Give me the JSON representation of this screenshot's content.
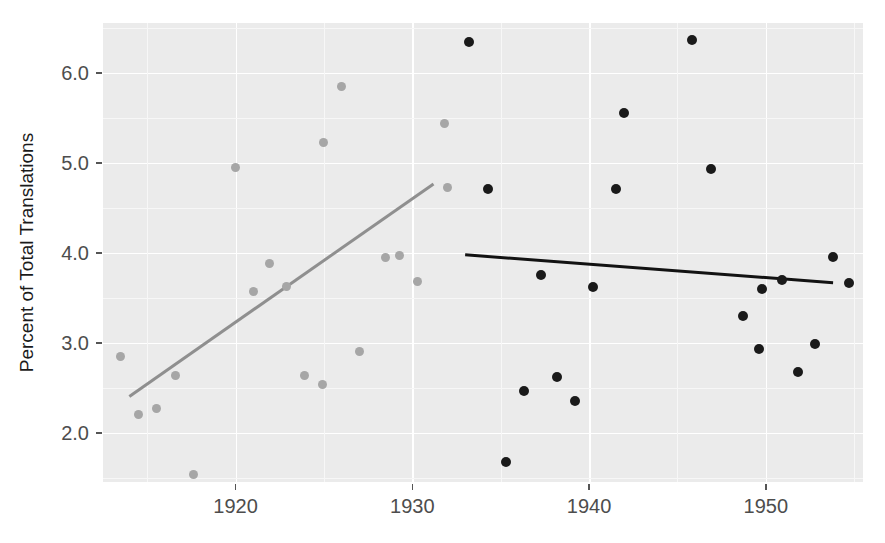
{
  "chart_data": {
    "type": "scatter",
    "title": "",
    "xlabel": "",
    "ylabel": "Percent of Total Translations",
    "xlim": [
      1912.5,
      1955.5
    ],
    "ylim": [
      1.45,
      6.55
    ],
    "xticks": [
      1920,
      1930,
      1940,
      1950
    ],
    "xticklabels": [
      "1920",
      "1930",
      "1940",
      "1950"
    ],
    "yticks": [
      2.0,
      3.0,
      4.0,
      5.0,
      6.0
    ],
    "yticklabels": [
      "2.0",
      "3.0",
      "4.0",
      "5.0",
      "6.0"
    ],
    "grid": true,
    "legend": "none",
    "panel_background": "#ebebeb",
    "series": [
      {
        "name": "early-period",
        "color": "#a6a6a6",
        "marker": "circle",
        "points": [
          {
            "x": 1913.5,
            "y": 2.85
          },
          {
            "x": 1914.5,
            "y": 2.2
          },
          {
            "x": 1915.5,
            "y": 2.27
          },
          {
            "x": 1916.6,
            "y": 2.63
          },
          {
            "x": 1917.6,
            "y": 1.53
          },
          {
            "x": 1920.0,
            "y": 4.95
          },
          {
            "x": 1921.0,
            "y": 3.57
          },
          {
            "x": 1921.9,
            "y": 3.88
          },
          {
            "x": 1922.9,
            "y": 3.62
          },
          {
            "x": 1923.9,
            "y": 2.63
          },
          {
            "x": 1924.9,
            "y": 2.53
          },
          {
            "x": 1925.0,
            "y": 5.22
          },
          {
            "x": 1926.0,
            "y": 5.85
          },
          {
            "x": 1927.0,
            "y": 2.9
          },
          {
            "x": 1928.5,
            "y": 3.95
          },
          {
            "x": 1929.3,
            "y": 3.97
          },
          {
            "x": 1930.3,
            "y": 3.68
          },
          {
            "x": 1931.8,
            "y": 5.43
          },
          {
            "x": 1932.0,
            "y": 4.72
          }
        ],
        "trend": {
          "x1": 1914.0,
          "y1": 2.41,
          "x2": 1931.2,
          "y2": 4.77,
          "color": "#8f8f8f"
        }
      },
      {
        "name": "late-period",
        "color": "#1a1a1a",
        "marker": "circle",
        "points": [
          {
            "x": 1933.2,
            "y": 6.34
          },
          {
            "x": 1934.3,
            "y": 4.71
          },
          {
            "x": 1935.3,
            "y": 1.67
          },
          {
            "x": 1936.3,
            "y": 2.46
          },
          {
            "x": 1937.3,
            "y": 3.75
          },
          {
            "x": 1938.2,
            "y": 2.62
          },
          {
            "x": 1939.2,
            "y": 2.35
          },
          {
            "x": 1940.2,
            "y": 3.62
          },
          {
            "x": 1941.5,
            "y": 4.71
          },
          {
            "x": 1942.0,
            "y": 5.55
          },
          {
            "x": 1945.8,
            "y": 6.36
          },
          {
            "x": 1946.9,
            "y": 4.93
          },
          {
            "x": 1948.7,
            "y": 3.3
          },
          {
            "x": 1949.6,
            "y": 2.93
          },
          {
            "x": 1949.8,
            "y": 3.6
          },
          {
            "x": 1950.9,
            "y": 3.7
          },
          {
            "x": 1951.8,
            "y": 2.67
          },
          {
            "x": 1952.8,
            "y": 2.98
          },
          {
            "x": 1953.8,
            "y": 3.95
          },
          {
            "x": 1954.7,
            "y": 3.66
          }
        ],
        "trend": {
          "x1": 1933.0,
          "y1": 3.97,
          "x2": 1953.8,
          "y2": 3.66,
          "color": "#121212"
        }
      }
    ]
  }
}
